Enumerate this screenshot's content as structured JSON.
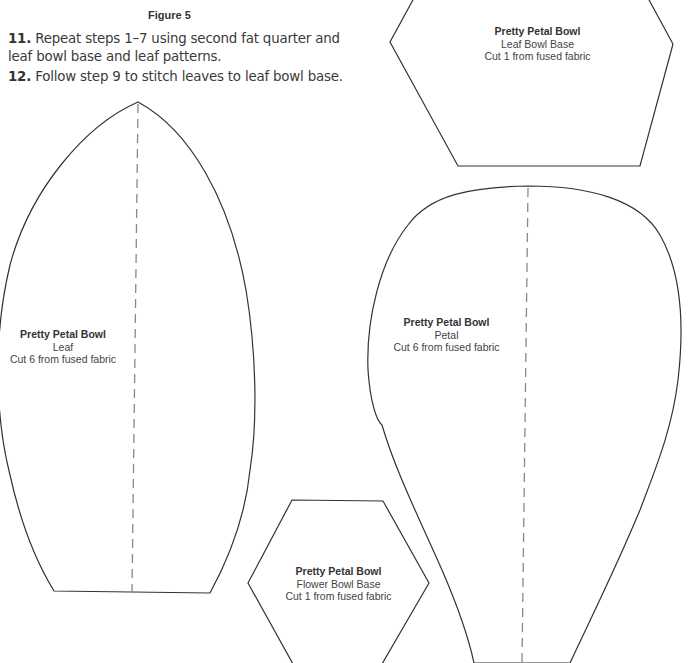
{
  "figure": {
    "label": "Figure 5"
  },
  "steps": [
    {
      "number": "11.",
      "text": " Repeat steps 1–7 using second fat quarter and leaf bowl base and leaf patterns."
    },
    {
      "number": "12.",
      "text": " Follow step 9 to stitch leaves to leaf bowl base."
    }
  ],
  "patterns": {
    "leaf_bowl_base": {
      "title": "Pretty Petal Bowl",
      "name": "Leaf Bowl Base",
      "instruction": "Cut 1 from fused fabric"
    },
    "leaf": {
      "title": "Pretty Petal Bowl",
      "name": "Leaf",
      "instruction": "Cut 6 from fused fabric"
    },
    "petal": {
      "title": "Pretty Petal Bowl",
      "name": "Petal",
      "instruction": "Cut 6 from fused fabric"
    },
    "flower_bowl_base": {
      "title": "Pretty Petal Bowl",
      "name": "Flower Bowl Base",
      "instruction": "Cut 1 from fused fabric"
    }
  },
  "colors": {
    "outline": "#333333",
    "dashed_line": "#888888"
  }
}
